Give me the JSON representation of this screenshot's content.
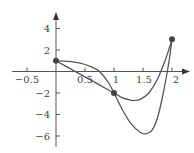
{
  "chart_data": {
    "type": "line",
    "title": "",
    "xlabel": "",
    "ylabel": "",
    "xlim": [
      -0.65,
      2.3
    ],
    "ylim": [
      -6.8,
      5.2
    ],
    "grid": false,
    "x_ticks": [
      -0.5,
      0.5,
      1,
      1.5,
      2
    ],
    "x_tick_labels": [
      "-0.5",
      "0.5",
      "1",
      "1.5",
      "2"
    ],
    "y_ticks": [
      4,
      2,
      -2,
      -4,
      -6
    ],
    "y_tick_labels": [
      "4",
      "2",
      "−2",
      "−4",
      "−6"
    ],
    "points": [
      {
        "x": 0,
        "y": 1
      },
      {
        "x": 1,
        "y": -2
      },
      {
        "x": 2,
        "y": 3
      }
    ],
    "series": [
      {
        "name": "curve-shallow",
        "x": [
          0,
          0.25,
          0.5,
          0.75,
          1,
          1.15,
          1.3,
          1.35,
          1.45,
          1.6,
          1.75,
          1.9,
          2
        ],
        "y": [
          1,
          0.25,
          -0.5,
          -1.25,
          -2,
          -2.45,
          -2.68,
          -2.7,
          -2.6,
          -2.0,
          -0.7,
          1.3,
          3
        ]
      },
      {
        "name": "curve-deep",
        "x": [
          0,
          0.2,
          0.4,
          0.6,
          0.75,
          0.9,
          1,
          1.15,
          1.3,
          1.45,
          1.55,
          1.65,
          1.75,
          1.85,
          1.95,
          2
        ],
        "y": [
          1,
          0.95,
          0.8,
          0.45,
          0,
          -1.0,
          -2,
          -3.6,
          -4.9,
          -5.65,
          -5.8,
          -5.5,
          -4.3,
          -2.0,
          1.0,
          3
        ]
      }
    ]
  },
  "axes": {
    "x_tick_labels": [
      "−0.5",
      "0.5",
      "1",
      "1.5",
      "2"
    ],
    "y_tick_labels": [
      "4",
      "2",
      "−2",
      "−4",
      "−6"
    ]
  }
}
